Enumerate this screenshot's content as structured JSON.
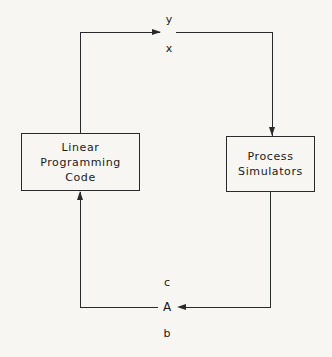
{
  "diagram": {
    "boxes": [
      {
        "id": "lp",
        "line1": "Linear Programming",
        "line2": "Code"
      },
      {
        "id": "sim",
        "line1": "Process",
        "line2": "Simulators"
      }
    ],
    "top_labels": {
      "above": "y",
      "below": "x"
    },
    "bottom_labels": {
      "above": "c",
      "middle": "A",
      "below": "b"
    },
    "flow": [
      {
        "from": "Linear Programming Code",
        "to": "Process Simulators",
        "carries": [
          "y",
          "x"
        ]
      },
      {
        "from": "Process Simulators",
        "to": "Linear Programming Code",
        "carries": [
          "c",
          "A",
          "b"
        ]
      }
    ]
  }
}
